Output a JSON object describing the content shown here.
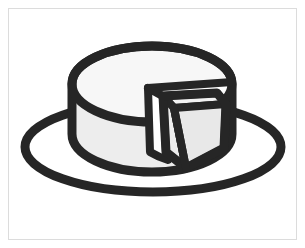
{
  "canvas": {
    "width": 305,
    "height": 248,
    "background_color": "#ffffff",
    "border_color": "#dcdcdc",
    "border_width": 1,
    "border_inset": 8,
    "title": "Cheese wheel with cut slice on a plate"
  },
  "palette": {
    "outline": "#262626",
    "top_face_fill": "#f7f7f7",
    "side_face_fill": "#ededed",
    "wedge_cut_face_fill": "#f2f2f2",
    "wedge_side_fill": "#e8e8e8",
    "plate_fill": "none",
    "white": "#ffffff"
  },
  "stroke_widths": {
    "plate": 9,
    "wheel_outline": 9,
    "wedge_outline": 8,
    "interior_edge": 7
  },
  "artwork": {
    "name": "cheese-wheel-illustration",
    "style": "black-outline clipart",
    "parts": [
      {
        "id": "plate",
        "label": "Plate ellipse"
      },
      {
        "id": "wheel-body",
        "label": "Cheese wheel cylinder body"
      },
      {
        "id": "wheel-top",
        "label": "Cheese wheel top face"
      },
      {
        "id": "notch",
        "label": "Wedge-shaped notch in wheel"
      },
      {
        "id": "wedge-slice",
        "label": "Separated cheese wedge"
      }
    ]
  },
  "geometry": {
    "plate_ellipse": {
      "cx": 153,
      "cy": 147,
      "rx": 128,
      "ry": 45
    },
    "wheel_top_ellipse": {
      "cx": 152,
      "cy": 84,
      "rx": 80,
      "ry": 38
    },
    "wheel_bottom_y": 172,
    "wheel_left_x": 72,
    "wheel_right_x": 232,
    "notch_apex": {
      "x": 148,
      "y": 88
    },
    "wedge_top_left": {
      "x": 162,
      "y": 95
    },
    "wedge_top_right": {
      "x": 218,
      "y": 93
    },
    "wedge_bottom": {
      "x": 186,
      "y": 168
    }
  }
}
